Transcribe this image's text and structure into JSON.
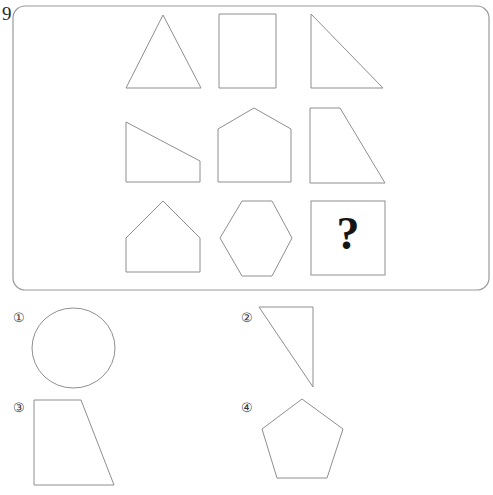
{
  "page": {
    "question_number": "9",
    "question_number_position": {
      "x": 2,
      "y": 20
    },
    "background_color": "#ffffff",
    "shape_stroke_color": "#8e8e93",
    "panel_stroke_color": "#9a9a9f",
    "ink_color": "#151515"
  },
  "matrix_panel": {
    "label": "matrix-panel",
    "x": 13,
    "y": 6,
    "width": 476,
    "height": 284,
    "corner_radius": 12,
    "rows": 3,
    "cols": 3
  },
  "matrix_cells": [
    {
      "index": 1,
      "row": 1,
      "col": 1,
      "name": "triangle",
      "icon": "equilateral-triangle-shape",
      "points": "163,15 201,88 126,88"
    },
    {
      "index": 2,
      "row": 1,
      "col": 2,
      "name": "rectangle",
      "icon": "rectangle-shape",
      "points": "219,14 276,14 276,88 219,88"
    },
    {
      "index": 3,
      "row": 1,
      "col": 3,
      "name": "right-triangle",
      "icon": "right-triangle-shape",
      "points": "311,14 383,88 311,88"
    },
    {
      "index": 4,
      "row": 2,
      "col": 1,
      "name": "right-trapezoid-low",
      "icon": "trapezoid-shape",
      "points": "126,122 200,161 200,182 126,182"
    },
    {
      "index": 5,
      "row": 2,
      "col": 2,
      "name": "house-pentagon-wide",
      "icon": "pentagon-house-shape",
      "points": "254,108 291,129 291,182 218,182 218,129"
    },
    {
      "index": 6,
      "row": 2,
      "col": 3,
      "name": "right-trapezoid-slant",
      "icon": "trapezoid-shape",
      "points": "310,108 340,108 385,183 310,183"
    },
    {
      "index": 7,
      "row": 3,
      "col": 1,
      "name": "house-pentagon",
      "icon": "pentagon-house-shape",
      "points": "163,201 200,238 200,272 126,272 126,238"
    },
    {
      "index": 8,
      "row": 3,
      "col": 2,
      "name": "hexagon",
      "icon": "hexagon-shape",
      "points": "242,201 272,201 292,238 272,276 242,276 220,238"
    },
    {
      "index": 9,
      "row": 3,
      "col": 3,
      "name": "missing-cell-question",
      "icon": "question-mark-box",
      "box": {
        "x": 311,
        "y": 201,
        "width": 74,
        "height": 74
      },
      "question_mark": "?",
      "question_mark_center": {
        "x": 348,
        "y": 238
      }
    }
  ],
  "answer_options": [
    {
      "id": 1,
      "label": "①",
      "label_position": {
        "x": 13,
        "y": 319
      },
      "name": "option-circle",
      "icon": "circle-shape",
      "shape_type": "circle",
      "circle": {
        "cx": 73.5,
        "cy": 348,
        "rx": 41.5,
        "ry": 40
      }
    },
    {
      "id": 2,
      "label": "②",
      "label_position": {
        "x": 241,
        "y": 319
      },
      "name": "option-right-triangle",
      "icon": "right-triangle-shape",
      "shape_type": "polygon",
      "points": "259,307 313,307 313,387"
    },
    {
      "id": 3,
      "label": "③",
      "label_position": {
        "x": 13,
        "y": 409
      },
      "name": "option-trapezoid",
      "icon": "trapezoid-shape",
      "shape_type": "polygon",
      "points": "34,400 81,400 114,485 34,485"
    },
    {
      "id": 4,
      "label": "④",
      "label_position": {
        "x": 241,
        "y": 409
      },
      "name": "option-pentagon",
      "icon": "pentagon-shape",
      "shape_type": "polygon",
      "points": "302,399 343,429 327,478 277,478 262,429"
    }
  ]
}
